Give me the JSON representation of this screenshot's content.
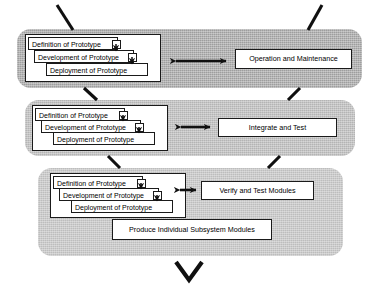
{
  "diagram": {
    "colors": {
      "band_top": "#9e9e9e",
      "band_middle": "#b4b4b4",
      "band_bottom": "#bdbdbd",
      "box_fill": "#ffffff",
      "stroke": "#1a1a1a"
    },
    "prototype_steps": [
      "Definition of Prototype",
      "Development  of Prototype",
      "Deployment  of Prototype"
    ],
    "bands": [
      {
        "id": "band-operation-maintenance",
        "right_box": "Operation and Maintenance",
        "arrow": "double-headed-horizontal-arrow"
      },
      {
        "id": "band-integrate-test",
        "right_box": "Integrate and Test",
        "arrow": "double-headed-horizontal-arrow"
      },
      {
        "id": "band-verify-test-modules",
        "right_box": "Verify and Test Modules",
        "arrow": "double-headed-horizontal-arrow",
        "extra_box": "Produce Individual Subsystem Modules"
      }
    ],
    "connectors": {
      "top_left_diagonal": "diagonal-line",
      "top_right_diagonal": "diagonal-line",
      "band1_band2_left": "diagonal-line",
      "band1_band2_right": "diagonal-line",
      "band2_band3_left": "diagonal-line",
      "band2_band3_right": "diagonal-line",
      "bottom_arrowhead": "v-arrowhead"
    }
  }
}
